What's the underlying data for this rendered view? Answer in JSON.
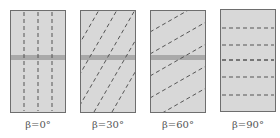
{
  "figure": {
    "panels": [
      {
        "angle_deg": 0,
        "label": "β=0°",
        "has_band": true
      },
      {
        "angle_deg": 30,
        "label": "β=30°",
        "has_band": true
      },
      {
        "angle_deg": 60,
        "label": "β=60°",
        "has_band": true
      },
      {
        "angle_deg": 90,
        "label": "β=90°",
        "has_band": false
      }
    ],
    "colors": {
      "panel_fill": "#d8d8d8",
      "panel_border": "#6e6e6e",
      "band_fill": "#a9a9a9",
      "dash_color": "#555555",
      "label_color": "#555555"
    }
  }
}
